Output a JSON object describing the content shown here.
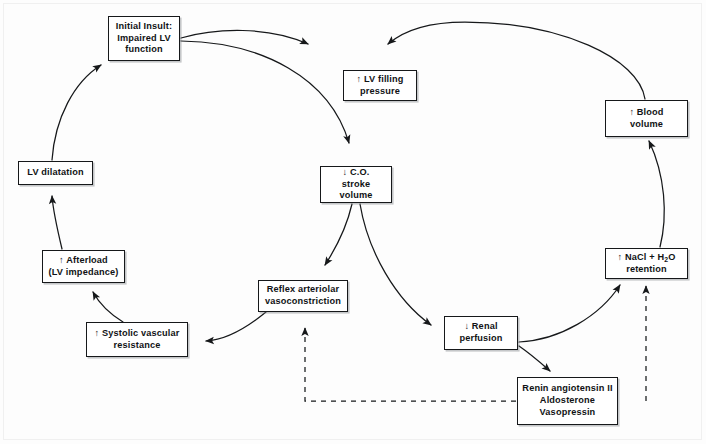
{
  "figure": {
    "type": "flow-cycle-diagram",
    "background_color": "#fdfdfd",
    "line_color": "#16181a",
    "box_border_color": "#16181a"
  },
  "nodes": {
    "initial_insult": {
      "id": "initial-insult",
      "label": "Initial Insult:\nImpaired LV\nfunction"
    },
    "lv_filling_pressure": {
      "id": "lv-filling-pressure",
      "label": "↑ LV filling\npressure"
    },
    "blood_volume": {
      "id": "blood-volume",
      "label": "↑ Blood\nvolume"
    },
    "lv_dilatation": {
      "id": "lv-dilatation",
      "label": "LV dilatation"
    },
    "cardiac_output": {
      "id": "cardiac-output",
      "label": "↓ C.O.\nstroke volume"
    },
    "afterload": {
      "id": "afterload",
      "label": "↑ Afterload\n(LV impedance)"
    },
    "nacl_retention": {
      "id": "nacl-retention",
      "label_html": "↑ NaCl + H<sub>2</sub>O\nretention",
      "label": "↑ NaCl + H2O retention"
    },
    "reflex_vasoconstriction": {
      "id": "reflex-vasoconstriction",
      "label": "Reflex arteriolar\nvasoconstriction"
    },
    "renal_perfusion": {
      "id": "renal-perfusion",
      "label": "↓ Renal\nperfusion"
    },
    "systolic_vascular_resistance": {
      "id": "systolic-vascular-resistance",
      "label": "↑ Systolic vascular\nresistance"
    },
    "renin_system": {
      "id": "renin-system",
      "label": "Renin angiotensin II\nAldosterone\nVasopressin"
    }
  },
  "edges": [
    {
      "from": "initial_insult",
      "to": "lv_filling_pressure",
      "style": "solid",
      "shape": "arc"
    },
    {
      "from": "initial_insult",
      "to": "cardiac_output",
      "style": "solid",
      "shape": "arc"
    },
    {
      "from": "cardiac_output",
      "to": "reflex_vasoconstriction",
      "style": "solid",
      "shape": "arc"
    },
    {
      "from": "cardiac_output",
      "to": "renal_perfusion",
      "style": "solid",
      "shape": "arc"
    },
    {
      "from": "reflex_vasoconstriction",
      "to": "systolic_vascular_resistance",
      "style": "solid",
      "shape": "arc"
    },
    {
      "from": "systolic_vascular_resistance",
      "to": "afterload",
      "style": "solid",
      "shape": "arc"
    },
    {
      "from": "afterload",
      "to": "lv_dilatation",
      "style": "solid",
      "shape": "arc"
    },
    {
      "from": "lv_dilatation",
      "to": "initial_insult",
      "style": "solid",
      "shape": "arc"
    },
    {
      "from": "renal_perfusion",
      "to": "nacl_retention",
      "style": "solid",
      "shape": "arc"
    },
    {
      "from": "renal_perfusion",
      "to": "renin_system",
      "style": "solid",
      "shape": "arc"
    },
    {
      "from": "renin_system",
      "to": "nacl_retention",
      "style": "dashed",
      "shape": "elbow"
    },
    {
      "from": "renin_system",
      "to": "reflex_vasoconstriction",
      "style": "dashed",
      "shape": "elbow"
    },
    {
      "from": "nacl_retention",
      "to": "blood_volume",
      "style": "solid",
      "shape": "arc"
    },
    {
      "from": "blood_volume",
      "to": "lv_filling_pressure",
      "style": "solid",
      "shape": "arc"
    }
  ]
}
